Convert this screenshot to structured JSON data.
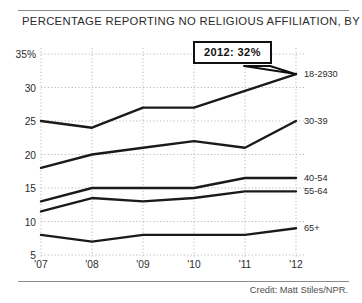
{
  "chart_data": {
    "type": "line",
    "title": "PERCENTAGE REPORTING NO RELIGIOUS AFFILIATION, BY AGE",
    "xlabel": "",
    "ylabel": "",
    "x": [
      "'07",
      "'08",
      "'09",
      "'10",
      "'11",
      "'12"
    ],
    "categories": [
      "'07",
      "'08",
      "'09",
      "'10",
      "'11",
      "'12"
    ],
    "ylim": [
      5,
      35
    ],
    "yticks": [
      "35%",
      "30",
      "25",
      "20",
      "15",
      "10",
      "5"
    ],
    "ytick_values": [
      35,
      30,
      25,
      20,
      15,
      10,
      5
    ],
    "xticks": [
      "'07",
      "'08",
      "'09",
      "'10",
      "'11",
      "'12"
    ],
    "grid": true,
    "grid_style": "dotted",
    "legend": "right-inline-labels",
    "line_color": "#1a1a1a",
    "series": [
      {
        "name": "18-2930",
        "label": "18-2930",
        "values": [
          25.0,
          24.0,
          27.0,
          27.0,
          29.5,
          32.0
        ]
      },
      {
        "name": "30-39",
        "label": "30-39",
        "values": [
          18.0,
          20.0,
          21.0,
          22.0,
          21.0,
          25.0
        ]
      },
      {
        "name": "40-54",
        "label": "40-54",
        "values": [
          13.0,
          15.0,
          15.0,
          15.0,
          16.5,
          16.5
        ]
      },
      {
        "name": "55-64",
        "label": "55-64",
        "values": [
          11.5,
          13.5,
          13.0,
          13.5,
          14.5,
          14.5
        ]
      },
      {
        "name": "65+",
        "label": "65+",
        "values": [
          8.0,
          7.0,
          8.0,
          8.0,
          8.0,
          9.0
        ]
      }
    ],
    "annotations": [
      {
        "text": "2012: 32%",
        "series": "18-2930",
        "x": "'12",
        "y": 32
      }
    ]
  },
  "credit": "Credit: Matt Stiles/NPR."
}
